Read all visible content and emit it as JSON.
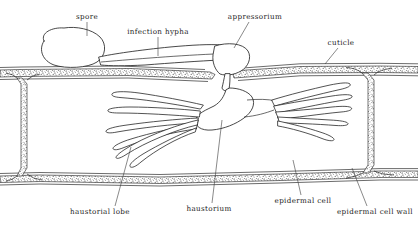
{
  "figure": {
    "background_color": "#ffffff",
    "ink_color": "#1a1a1a",
    "label_color": "#222222",
    "style": "line-drawing"
  },
  "labels": {
    "spore": "spore",
    "infection_hypha": "infection hypha",
    "appressorium": "appressorium",
    "cuticle": "cuticle",
    "haustorial_lobe": "haustorial lobe",
    "haustorium": "haustorium",
    "epidermal_cell": "epidermal cell",
    "epidermal_cell_wall": "epidermal cell wall"
  },
  "structures": [
    {
      "name": "spore",
      "description": "rounded blob resting on the cuticle surface at upper left"
    },
    {
      "name": "infection-hypha",
      "description": "elongated tube running right from the spore along the cuticle"
    },
    {
      "name": "appressorium",
      "description": "swollen tip of the infection hypha that penetrates the cuticle"
    },
    {
      "name": "cuticle",
      "description": "stippled layer covering the outer surface of the epidermal cell"
    },
    {
      "name": "epidermal-cell-wall",
      "description": "stippled bands forming the top, bottom and vertical cell walls"
    },
    {
      "name": "epidermal-cell",
      "description": "large interior space bounded by the cell walls"
    },
    {
      "name": "haustorium",
      "description": "central fungal body inside the epidermal cell, fed by a penetration neck"
    },
    {
      "name": "haustorial-lobe",
      "description": "finger-like projections radiating left and right from the haustorium"
    }
  ],
  "lobe_counts": {
    "left": 6,
    "right": 5
  }
}
